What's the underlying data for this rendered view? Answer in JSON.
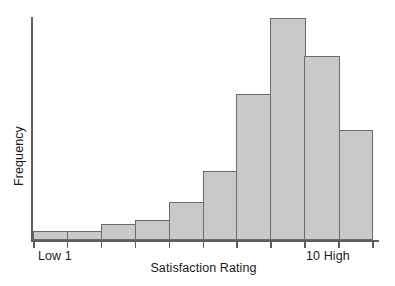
{
  "chart_data": {
    "type": "bar",
    "title": "",
    "subtitle": "",
    "xlabel": "Satisfaction Rating",
    "ylabel": "Frequency",
    "categories": [
      "1",
      "2",
      "3",
      "4",
      "5",
      "6",
      "7",
      "8",
      "9",
      "10"
    ],
    "values": [
      4,
      4,
      7,
      9,
      17,
      31,
      65,
      99,
      82,
      49
    ],
    "ylim": [
      0,
      100
    ],
    "xlim": [
      0.5,
      10.5
    ],
    "grid": false,
    "legend": null,
    "legend_position": "none",
    "bar_fill_color": "#c9c9c9",
    "bar_edge_color": "#6b6b6b",
    "axis_color": "#5e5e5e",
    "y_axis_ticks_shown": false,
    "x_tick_labels": {
      "left": "Low 1",
      "right": "10 High"
    },
    "annotations": []
  },
  "axis": {
    "y_title": "Frequency",
    "x_title": "Satisfaction Rating",
    "x_label_low": "Low 1",
    "x_label_high": "10 High"
  }
}
